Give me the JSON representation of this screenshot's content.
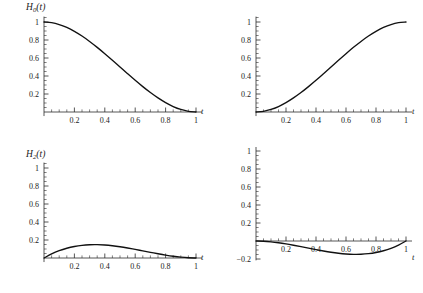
{
  "figure": {
    "type": "multi-panel-plot",
    "panels": 4,
    "layout": "2x2",
    "background": "#ffffff",
    "curve_color": "#111111",
    "axis_color": "#2b2b2b"
  },
  "axis_label_x": "t",
  "panels": [
    {
      "id": "panel-h0",
      "label_base": "H",
      "label_sub": "0",
      "label_arg": "(t)",
      "label_full": "H0(t)"
    },
    {
      "id": "panel-h1",
      "label_base": "H",
      "label_sub": "1",
      "label_arg": "(t)",
      "label_full": "H1(t)"
    },
    {
      "id": "panel-h2",
      "label_base": "H",
      "label_sub": "2",
      "label_arg": "(t)",
      "label_full": "H2(t)"
    },
    {
      "id": "panel-h3",
      "label_base": "H",
      "label_sub": "3",
      "label_arg": "(t)",
      "label_full": "H3(t)"
    }
  ],
  "chart_data": [
    {
      "type": "line",
      "title": "H0(t)",
      "xlabel": "t",
      "ylabel": "H0(t)",
      "xlim": [
        0,
        1
      ],
      "ylim": [
        0,
        1.08
      ],
      "grid": false,
      "legend": null,
      "xticks": [
        0.2,
        0.4,
        0.6,
        0.8,
        1
      ],
      "xticklabels": [
        "0.2",
        "0.4",
        "0.6",
        "0.8",
        "1"
      ],
      "yticks": [
        0.2,
        0.4,
        0.6,
        0.8,
        1
      ],
      "yticklabels": [
        "0.2",
        "0.4",
        "0.6",
        "0.8",
        "1"
      ],
      "minor_tick_step": 0.05,
      "x": [
        0,
        0.05,
        0.1,
        0.15,
        0.2,
        0.25,
        0.3,
        0.35,
        0.4,
        0.45,
        0.5,
        0.55,
        0.6,
        0.65,
        0.7,
        0.75,
        0.8,
        0.85,
        0.9,
        0.95,
        1
      ],
      "values": [
        1,
        0.9928,
        0.972,
        0.9393,
        0.896,
        0.8438,
        0.784,
        0.7183,
        0.648,
        0.5748,
        0.5,
        0.4253,
        0.352,
        0.2818,
        0.216,
        0.1563,
        0.104,
        0.0607,
        0.028,
        0.0073,
        0
      ]
    },
    {
      "type": "line",
      "title": "H1(t)",
      "xlabel": "t",
      "ylabel": "H1(t)",
      "xlim": [
        0,
        1
      ],
      "ylim": [
        0,
        1.08
      ],
      "grid": false,
      "legend": null,
      "xticks": [
        0.2,
        0.4,
        0.6,
        0.8,
        1
      ],
      "xticklabels": [
        "0.2",
        "0.4",
        "0.6",
        "0.8",
        "1"
      ],
      "yticks": [
        0.2,
        0.4,
        0.6,
        0.8,
        1
      ],
      "yticklabels": [
        "0.2",
        "0.4",
        "0.6",
        "0.8",
        "1"
      ],
      "minor_tick_step": 0.05,
      "x": [
        0,
        0.05,
        0.1,
        0.15,
        0.2,
        0.25,
        0.3,
        0.35,
        0.4,
        0.45,
        0.5,
        0.55,
        0.6,
        0.65,
        0.7,
        0.75,
        0.8,
        0.85,
        0.9,
        0.95,
        1
      ],
      "values": [
        0,
        0.0073,
        0.028,
        0.0607,
        0.104,
        0.1563,
        0.216,
        0.2818,
        0.352,
        0.4253,
        0.5,
        0.5748,
        0.648,
        0.7183,
        0.784,
        0.8438,
        0.896,
        0.9393,
        0.972,
        0.9928,
        1
      ]
    },
    {
      "type": "line",
      "title": "H2(t)",
      "xlabel": "t",
      "ylabel": "H2(t)",
      "xlim": [
        0,
        1
      ],
      "ylim": [
        0,
        1.08
      ],
      "grid": false,
      "legend": null,
      "xticks": [
        0.2,
        0.4,
        0.6,
        0.8,
        1
      ],
      "xticklabels": [
        "0.2",
        "0.4",
        "0.6",
        "0.8",
        "1"
      ],
      "yticks": [
        0.2,
        0.4,
        0.6,
        0.8,
        1
      ],
      "yticklabels": [
        "0.2",
        "0.4",
        "0.6",
        "0.8",
        "1"
      ],
      "minor_tick_step": 0.05,
      "peak_value": 0.1481,
      "peak_at_x": 0.3333,
      "x": [
        0,
        0.05,
        0.1,
        0.15,
        0.2,
        0.25,
        0.3,
        0.35,
        0.4,
        0.45,
        0.5,
        0.55,
        0.6,
        0.65,
        0.7,
        0.75,
        0.8,
        0.85,
        0.9,
        0.95,
        1
      ],
      "values": [
        0,
        0.0451,
        0.081,
        0.1084,
        0.128,
        0.1406,
        0.147,
        0.1479,
        0.144,
        0.1361,
        0.125,
        0.1114,
        0.096,
        0.0796,
        0.063,
        0.0469,
        0.032,
        0.0191,
        0.009,
        0.0024,
        0
      ]
    },
    {
      "type": "line",
      "title": "H3(t)",
      "xlabel": "t",
      "ylabel": "H3(t)",
      "xlim": [
        0,
        1
      ],
      "ylim": [
        -0.24,
        1.08
      ],
      "grid": false,
      "legend": null,
      "xticks": [
        0.2,
        0.4,
        0.6,
        0.8,
        1
      ],
      "xticklabels": [
        "0.2",
        "0.4",
        "0.6",
        "0.8",
        "1"
      ],
      "yticks": [
        -0.2,
        0.2,
        0.4,
        0.6,
        0.8,
        1
      ],
      "yticklabels": [
        "-0.2",
        "0.2",
        "0.4",
        "0.6",
        "0.8",
        "1"
      ],
      "minor_tick_step": 0.05,
      "min_value": -0.1481,
      "min_at_x": 0.6667,
      "x": [
        0,
        0.05,
        0.1,
        0.15,
        0.2,
        0.25,
        0.3,
        0.35,
        0.4,
        0.45,
        0.5,
        0.55,
        0.6,
        0.65,
        0.7,
        0.75,
        0.8,
        0.85,
        0.9,
        0.95,
        1
      ],
      "values": [
        0,
        -0.0024,
        -0.009,
        -0.0191,
        -0.032,
        -0.0469,
        -0.063,
        -0.0796,
        -0.096,
        -0.1114,
        -0.125,
        -0.1361,
        -0.144,
        -0.1479,
        -0.147,
        -0.1406,
        -0.128,
        -0.1084,
        -0.081,
        -0.0451,
        0
      ]
    }
  ]
}
